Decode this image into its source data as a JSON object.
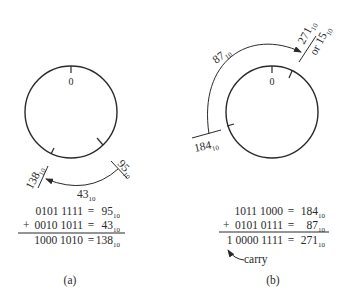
{
  "figure": {
    "panel_a": {
      "caption": "(a)",
      "circle_zero_label": "0",
      "start_label": {
        "value": "95",
        "base": "10"
      },
      "end_label": {
        "value": "138",
        "base": "10"
      },
      "arc_label": {
        "value": "43",
        "base": "10"
      },
      "sum": [
        {
          "prefix": "",
          "binary": "0101 1111",
          "eq": "=",
          "decimal": "95",
          "base": "10"
        },
        {
          "prefix": "+",
          "binary": "0010 1011",
          "eq": "=",
          "decimal": "43",
          "base": "10"
        },
        {
          "prefix": "",
          "binary": "1000 1010",
          "eq": "=",
          "decimal": "138",
          "base": "10"
        }
      ]
    },
    "panel_b": {
      "caption": "(b)",
      "circle_zero_label": "0",
      "start_label": {
        "value": "184",
        "base": "10"
      },
      "end_label": {
        "value": "271",
        "base": "10",
        "alt_prefix": "or",
        "alt_value": "15",
        "alt_base": "10"
      },
      "arc_label": {
        "value": "87",
        "base": "10"
      },
      "sum": [
        {
          "prefix": "",
          "binary": "1011 1000",
          "eq": "=",
          "decimal": "184",
          "base": "10"
        },
        {
          "prefix": "+",
          "binary": "0101 0111",
          "eq": "=",
          "decimal": "87",
          "base": "10"
        },
        {
          "prefix": "",
          "binary": "1 0000 1111",
          "eq": "=",
          "decimal": "271",
          "base": "10"
        }
      ],
      "carry_label": "carry"
    },
    "colors": {
      "ink": "#2a2a2a",
      "background": "#ffffff"
    }
  }
}
